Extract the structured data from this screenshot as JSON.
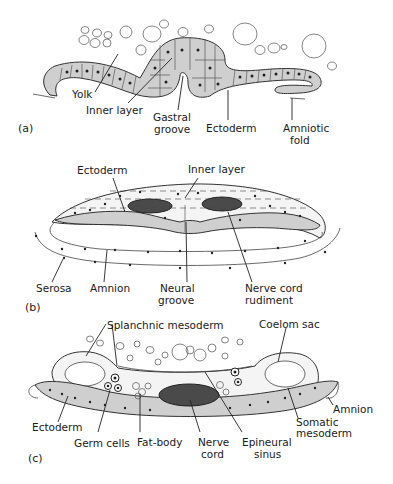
{
  "figure": {
    "panels": [
      {
        "id": "a",
        "panel_label": "(a)",
        "labels": {
          "yolk": "Yolk",
          "inner_layer": "Inner layer",
          "gastral_groove_1": "Gastral",
          "gastral_groove_2": "groove",
          "ectoderm": "Ectoderm",
          "amniotic_fold_1": "Amniotic",
          "amniotic_fold_2": "fold"
        }
      },
      {
        "id": "b",
        "panel_label": "(b)",
        "labels": {
          "ectoderm": "Ectoderm",
          "inner_layer": "Inner layer",
          "serosa": "Serosa",
          "amnion": "Amnion",
          "neural_groove_1": "Neural",
          "neural_groove_2": "groove",
          "nerve_cord_rudiment_1": "Nerve cord",
          "nerve_cord_rudiment_2": "rudiment"
        }
      },
      {
        "id": "c",
        "panel_label": "(c)",
        "labels": {
          "splanchnic_mesoderm": "Splanchnic mesoderm",
          "coelom_sac": "Coelom sac",
          "amnion": "Amnion",
          "ectoderm": "Ectoderm",
          "somatic_mesoderm_1": "Somatic",
          "somatic_mesoderm_2": "mesoderm",
          "germ_cells": "Germ cells",
          "fat_body": "Fat-body",
          "nerve_cord_1": "Nerve",
          "nerve_cord_2": "cord",
          "epineural_sinus_1": "Epineural",
          "epineural_sinus_2": "sinus"
        }
      }
    ]
  }
}
